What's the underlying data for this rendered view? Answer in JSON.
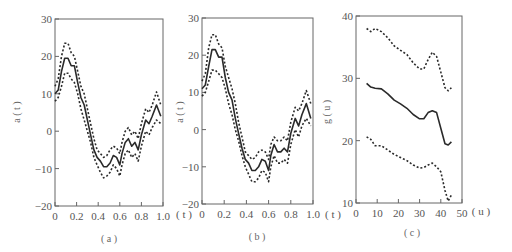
{
  "chart_data": [
    {
      "type": "line",
      "panel_label": "(a)",
      "title": "",
      "xlabel": "(t)",
      "ylabel": "a(t)",
      "xlim": [
        0,
        1.0
      ],
      "ylim": [
        -20,
        30
      ],
      "xticks": [
        "0",
        "0.2",
        "0.4",
        "0.6",
        "0.8",
        "1.0"
      ],
      "yticks": [
        "-20",
        "-10",
        "0",
        "10",
        "20",
        "30"
      ],
      "grid": false,
      "x": [
        0,
        0.03,
        0.06,
        0.09,
        0.12,
        0.15,
        0.18,
        0.21,
        0.24,
        0.27,
        0.3,
        0.33,
        0.36,
        0.39,
        0.42,
        0.45,
        0.48,
        0.51,
        0.54,
        0.57,
        0.6,
        0.62,
        0.65,
        0.68,
        0.71,
        0.74,
        0.77,
        0.8,
        0.84,
        0.87,
        0.9,
        0.94,
        0.98
      ],
      "series": [
        {
          "name": "estimate",
          "style": "solid",
          "values": [
            10,
            11,
            16,
            19.5,
            19.5,
            17.5,
            17.5,
            13,
            9,
            7,
            3,
            -1,
            -5,
            -7,
            -8,
            -9.5,
            -9.5,
            -8.5,
            -6.5,
            -7,
            -9,
            -6,
            -3,
            -2,
            -4,
            -3,
            -5,
            -1,
            3,
            2,
            4,
            7,
            4
          ]
        },
        {
          "name": "upper bound",
          "style": "dotted",
          "values": [
            12,
            14,
            20,
            23.5,
            23.5,
            21,
            20,
            16,
            12,
            10,
            6,
            2,
            -2,
            -5,
            -6,
            -7,
            -6.5,
            -5,
            -4,
            -4.5,
            -6,
            -3,
            0,
            1,
            -1,
            0,
            -2,
            2,
            6,
            5,
            7,
            10.5,
            7
          ]
        },
        {
          "name": "lower bound",
          "style": "dotted",
          "values": [
            8,
            9,
            12,
            15.5,
            15.5,
            14,
            13,
            10,
            6,
            3,
            0,
            -3,
            -7,
            -9,
            -11,
            -12.5,
            -12,
            -11,
            -9,
            -10,
            -12,
            -9,
            -6,
            -5,
            -7,
            -6,
            -8,
            -4,
            0,
            -1,
            1,
            3,
            2
          ]
        }
      ]
    },
    {
      "type": "line",
      "panel_label": "(b)",
      "title": "",
      "xlabel": "(t)",
      "ylabel": "a(t)",
      "xlim": [
        0,
        1.0
      ],
      "ylim": [
        -20,
        30
      ],
      "xticks": [
        "0",
        "0.2",
        "0.4",
        "0.6",
        "0.8",
        "1.0"
      ],
      "yticks": [
        "-20",
        "-10",
        "0",
        "10",
        "20",
        "30"
      ],
      "grid": false,
      "x": [
        0,
        0.03,
        0.06,
        0.09,
        0.12,
        0.15,
        0.18,
        0.21,
        0.24,
        0.27,
        0.3,
        0.33,
        0.36,
        0.39,
        0.42,
        0.45,
        0.48,
        0.51,
        0.54,
        0.57,
        0.6,
        0.62,
        0.65,
        0.68,
        0.71,
        0.74,
        0.77,
        0.8,
        0.84,
        0.87,
        0.9,
        0.94,
        0.98
      ],
      "series": [
        {
          "name": "estimate",
          "style": "solid",
          "values": [
            11,
            12,
            17,
            21.5,
            21.5,
            19.5,
            19.5,
            14,
            10,
            8,
            3,
            -1,
            -5,
            -8,
            -9,
            -11,
            -11,
            -10,
            -8,
            -8.5,
            -11,
            -7,
            -4,
            -6,
            -6,
            -5,
            -6,
            -1,
            3,
            1,
            4,
            7,
            3
          ]
        },
        {
          "name": "upper bound",
          "style": "dotted",
          "values": [
            13,
            15,
            22,
            25.5,
            25.5,
            23,
            22,
            17,
            14,
            11,
            7,
            2,
            -2,
            -6,
            -7,
            -8,
            -7.5,
            -6,
            -5.5,
            -6,
            -8,
            -4,
            -2,
            -3,
            -3,
            -2,
            -3,
            2,
            6,
            5,
            7,
            10.5,
            7
          ]
        },
        {
          "name": "lower bound",
          "style": "dotted",
          "values": [
            9,
            10,
            13,
            16,
            16,
            15,
            14,
            11,
            7,
            4,
            0,
            -3,
            -7,
            -10,
            -12,
            -14,
            -14,
            -13,
            -11,
            -11.5,
            -14,
            -10,
            -7,
            -9,
            -9,
            -8,
            -9,
            -4,
            0,
            -2,
            1,
            3,
            1
          ]
        }
      ]
    },
    {
      "type": "line",
      "panel_label": "(c)",
      "title": "",
      "xlabel": "(u)",
      "ylabel": "g(u)",
      "xlim": [
        0,
        50
      ],
      "ylim": [
        10,
        40
      ],
      "xticks": [
        "0",
        "10",
        "20",
        "30",
        "40",
        "50"
      ],
      "yticks": [
        "10",
        "20",
        "30",
        "40"
      ],
      "grid": false,
      "x": [
        5,
        7,
        9,
        12,
        15,
        18,
        21,
        24,
        27,
        30,
        32,
        34,
        36,
        38,
        40,
        42,
        43.5,
        45
      ],
      "series": [
        {
          "name": "estimate",
          "style": "solid",
          "values": [
            29.2,
            28.6,
            28.4,
            28.3,
            27.5,
            26.5,
            25.9,
            25.2,
            24.2,
            23.5,
            23.5,
            24.5,
            24.8,
            24.5,
            22,
            19.5,
            19.3,
            19.8
          ]
        },
        {
          "name": "upper bound",
          "style": "dotted",
          "values": [
            38,
            37.5,
            38,
            37.5,
            36.5,
            35.2,
            34.5,
            33.8,
            32.5,
            31.5,
            31.5,
            33,
            34.2,
            33.5,
            31,
            28.5,
            28,
            28.5
          ]
        },
        {
          "name": "lower bound",
          "style": "dotted",
          "values": [
            20.6,
            20.2,
            19.2,
            19.2,
            18.5,
            17.8,
            17.3,
            16.8,
            16.1,
            15.6,
            15.7,
            16.1,
            16.4,
            15.8,
            15,
            12,
            10.3,
            11.3
          ]
        }
      ]
    }
  ],
  "labels": {
    "panel_a_caption": "( a )",
    "panel_b_caption": "( b )",
    "panel_c_caption": "( c )",
    "panel_a_ylabel": "a ( t )",
    "panel_b_ylabel": "a ( t )",
    "panel_c_ylabel": "g ( u )",
    "panel_a_xunit": "( t )",
    "panel_b_xunit": "( t )",
    "panel_c_xunit": "( u )"
  },
  "colors": {
    "line": "#2a2a2a",
    "axis": "#555555",
    "text": "#555555"
  }
}
